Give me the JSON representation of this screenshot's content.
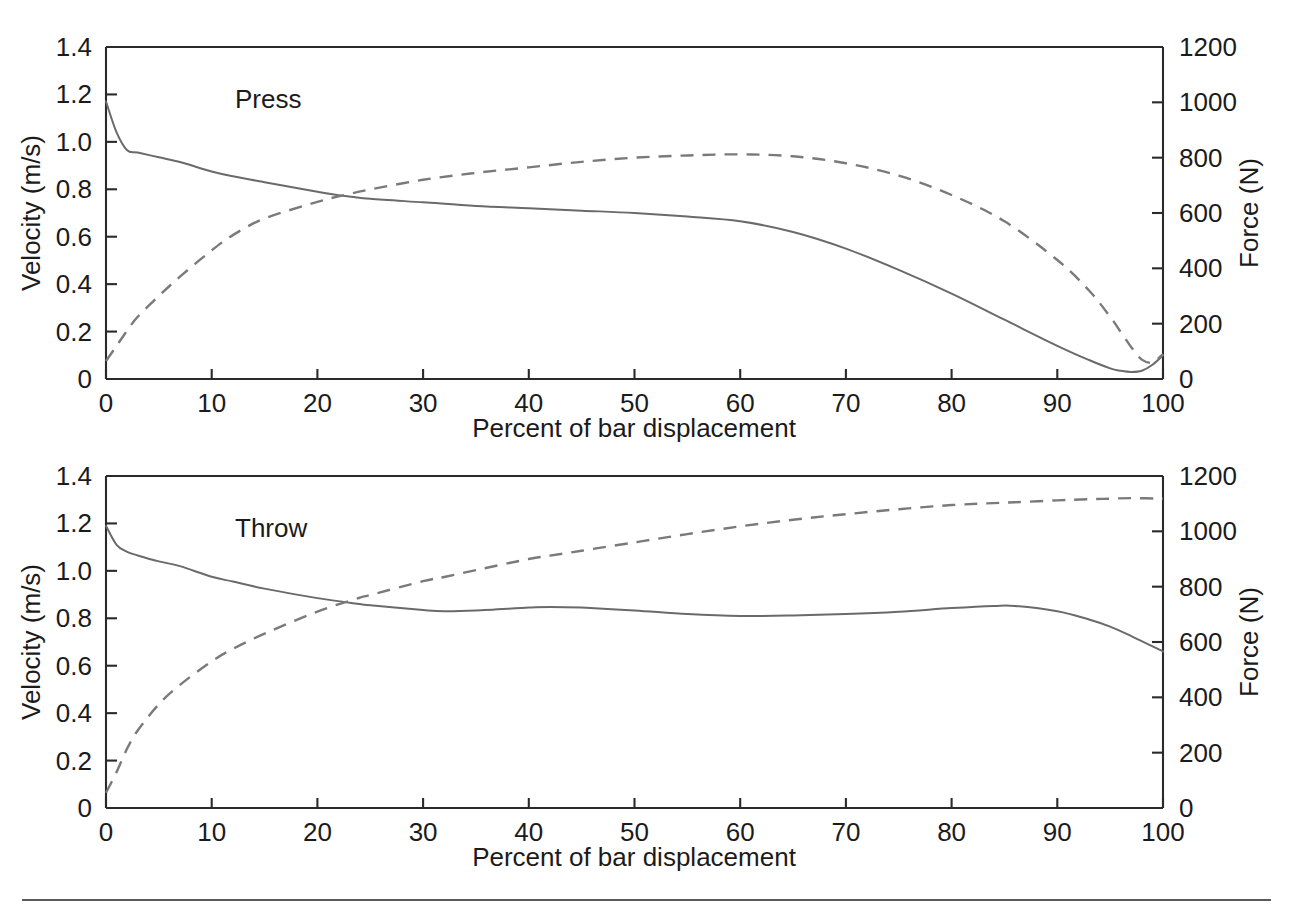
{
  "figure": {
    "panels": [
      {
        "id": "press",
        "label": "Press",
        "xlabel": "Percent of bar displacement",
        "ylabel_left": "Velocity (m/s)",
        "ylabel_right": "Force (N)"
      },
      {
        "id": "throw",
        "label": "Throw",
        "xlabel": "Percent of bar displacement",
        "ylabel_left": "Velocity (m/s)",
        "ylabel_right": "Force (N)"
      }
    ],
    "axes": {
      "x_ticks": [
        "0",
        "10",
        "20",
        "30",
        "40",
        "50",
        "60",
        "70",
        "80",
        "90",
        "100"
      ],
      "y_left_ticks": [
        "0",
        "0.2",
        "0.4",
        "0.6",
        "0.8",
        "1.0",
        "1.2",
        "1.4"
      ],
      "y_right_ticks": [
        "0",
        "200",
        "400",
        "600",
        "800",
        "1000",
        "1200"
      ]
    },
    "footer_rule_color": "#5a5a5a"
  },
  "chart_data": [
    {
      "type": "line",
      "title": "Press",
      "xlabel": "Percent of bar displacement",
      "ylabel": "Velocity (m/s)",
      "ylabel_secondary": "Force (N)",
      "xlim": [
        0,
        100
      ],
      "ylim": [
        0,
        1.4
      ],
      "ylim_secondary": [
        0,
        1200
      ],
      "grid": false,
      "legend": "none",
      "x": [
        0,
        1,
        2,
        3,
        5,
        7,
        10,
        12,
        15,
        20,
        22,
        25,
        30,
        35,
        40,
        45,
        50,
        55,
        60,
        65,
        70,
        75,
        80,
        85,
        90,
        93,
        95,
        96,
        97,
        98,
        99,
        100
      ],
      "series": [
        {
          "name": "Velocity",
          "style": "solid",
          "axis": "left",
          "units": "m/s",
          "values": [
            1.17,
            1.04,
            0.965,
            0.955,
            0.935,
            0.915,
            0.875,
            0.855,
            0.83,
            0.79,
            0.775,
            0.76,
            0.745,
            0.73,
            0.72,
            0.71,
            0.7,
            0.685,
            0.665,
            0.62,
            0.55,
            0.46,
            0.36,
            0.25,
            0.14,
            0.08,
            0.045,
            0.035,
            0.03,
            0.035,
            0.06,
            0.1
          ]
        },
        {
          "name": "Force",
          "style": "dashed",
          "axis": "right",
          "units": "N",
          "values": [
            65,
            120,
            175,
            225,
            300,
            370,
            465,
            520,
            580,
            640,
            660,
            685,
            720,
            745,
            765,
            785,
            800,
            808,
            812,
            805,
            780,
            735,
            665,
            570,
            430,
            320,
            225,
            170,
            115,
            70,
            60,
            90
          ]
        }
      ]
    },
    {
      "type": "line",
      "title": "Throw",
      "xlabel": "Percent of bar displacement",
      "ylabel": "Velocity (m/s)",
      "ylabel_secondary": "Force (N)",
      "xlim": [
        0,
        100
      ],
      "ylim": [
        0,
        1.4
      ],
      "ylim_secondary": [
        0,
        1200
      ],
      "grid": false,
      "legend": "none",
      "x": [
        0,
        1,
        2,
        3,
        5,
        7,
        10,
        12,
        15,
        20,
        24,
        25,
        30,
        32,
        35,
        40,
        42,
        45,
        50,
        55,
        60,
        65,
        70,
        75,
        80,
        84,
        86,
        90,
        93,
        95,
        97,
        100
      ],
      "series": [
        {
          "name": "Velocity",
          "style": "solid",
          "axis": "left",
          "units": "m/s",
          "values": [
            1.19,
            1.11,
            1.08,
            1.065,
            1.04,
            1.02,
            0.975,
            0.955,
            0.925,
            0.885,
            0.86,
            0.855,
            0.835,
            0.83,
            0.833,
            0.845,
            0.848,
            0.845,
            0.833,
            0.818,
            0.81,
            0.812,
            0.818,
            0.828,
            0.843,
            0.852,
            0.852,
            0.83,
            0.795,
            0.765,
            0.725,
            0.66
          ]
        },
        {
          "name": "Force",
          "style": "dashed",
          "axis": "right",
          "units": "N",
          "values": [
            55,
            130,
            215,
            280,
            375,
            445,
            530,
            575,
            630,
            710,
            760,
            770,
            820,
            835,
            860,
            900,
            912,
            930,
            960,
            990,
            1018,
            1042,
            1062,
            1080,
            1095,
            1102,
            1105,
            1112,
            1116,
            1118,
            1120,
            1118
          ]
        }
      ]
    }
  ]
}
